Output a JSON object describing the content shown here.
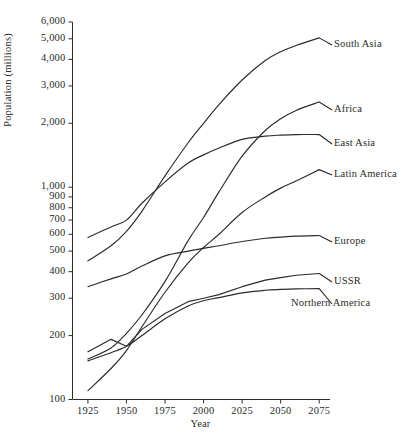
{
  "chart_data": {
    "type": "line",
    "title": "",
    "xlabel": "Year",
    "ylabel": "Population (millions)",
    "yscale": "log",
    "ylim": [
      100,
      6000
    ],
    "xlim": [
      1915,
      2082
    ],
    "grid": false,
    "legend_position": "right-inline-labels",
    "y_ticks": [
      100,
      200,
      300,
      400,
      500,
      600,
      700,
      800,
      900,
      1000,
      2000,
      3000,
      4000,
      5000,
      6000
    ],
    "y_tick_labels": [
      "100",
      "200",
      "300",
      "400",
      "500",
      "600",
      "700",
      "800",
      "900",
      "1,000",
      "2,000",
      "3,000",
      "4,000",
      "5,000",
      "6,000"
    ],
    "x_ticks": [
      1925,
      1950,
      1975,
      2000,
      2025,
      2050,
      2075
    ],
    "x_tick_labels": [
      "1925",
      "1950",
      "1975",
      "2000",
      "2025",
      "2050",
      "2075"
    ],
    "x": [
      1925,
      1940,
      1950,
      1960,
      1975,
      1990,
      2000,
      2010,
      2025,
      2040,
      2050,
      2060,
      2075
    ],
    "series": [
      {
        "name": "South Asia",
        "label": "South Asia",
        "color": "#2b2b2b",
        "values": [
          450,
          530,
          620,
          770,
          1130,
          1620,
          2000,
          2450,
          3200,
          3950,
          4350,
          4650,
          5050
        ]
      },
      {
        "name": "Africa",
        "label": "Africa",
        "color": "#2b2b2b",
        "values": [
          155,
          175,
          205,
          250,
          360,
          560,
          720,
          950,
          1400,
          1850,
          2100,
          2300,
          2520
        ]
      },
      {
        "name": "East Asia",
        "label": "East Asia",
        "color": "#2b2b2b",
        "values": [
          580,
          650,
          700,
          840,
          1060,
          1300,
          1420,
          1530,
          1680,
          1740,
          1760,
          1770,
          1770
        ]
      },
      {
        "name": "Latin America",
        "label": "Latin America",
        "color": "#2b2b2b",
        "values": [
          110,
          140,
          170,
          220,
          320,
          440,
          520,
          600,
          760,
          900,
          990,
          1070,
          1210
        ]
      },
      {
        "name": "Europe",
        "label": "Europe",
        "color": "#2b2b2b",
        "values": [
          340,
          370,
          390,
          425,
          475,
          500,
          515,
          530,
          555,
          575,
          582,
          588,
          592
        ]
      },
      {
        "name": "USSR",
        "label": "USSR",
        "color": "#2b2b2b",
        "values": [
          168,
          192,
          178,
          214,
          254,
          289,
          300,
          312,
          340,
          365,
          375,
          385,
          392
        ]
      },
      {
        "name": "Northern America",
        "label": "Northern America",
        "color": "#2b2b2b",
        "values": [
          152,
          166,
          178,
          200,
          240,
          276,
          292,
          302,
          318,
          327,
          330,
          332,
          333
        ]
      }
    ]
  },
  "axes": {
    "y_axis_name": "population-axis",
    "x_axis_name": "year-axis"
  }
}
